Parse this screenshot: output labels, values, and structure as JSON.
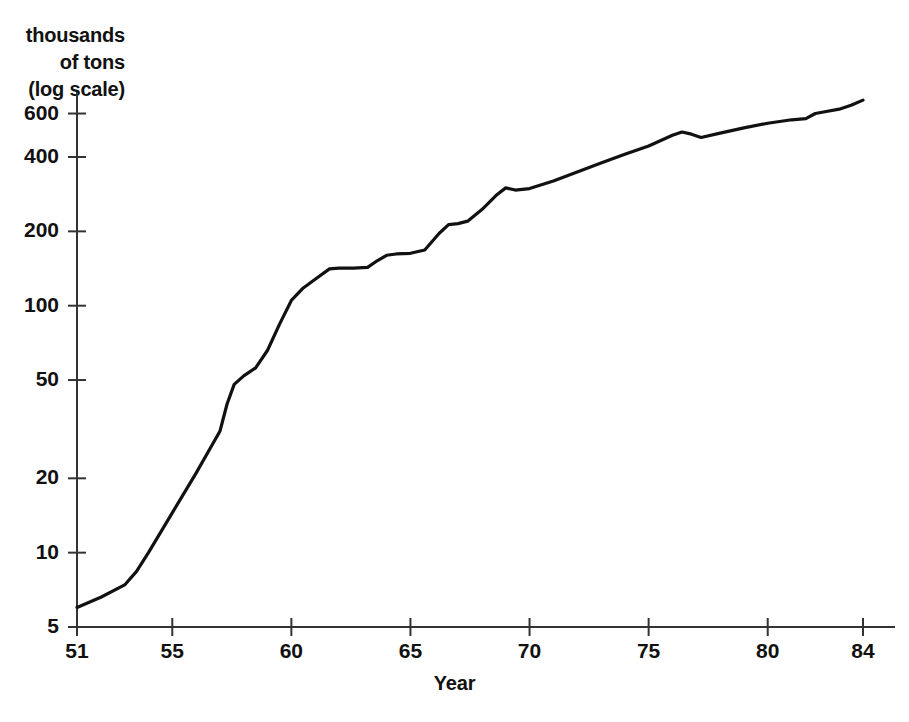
{
  "figure": {
    "y_axis_caption_lines": [
      "thousands",
      "of tons",
      "(log scale)"
    ],
    "x_axis_title": "Year"
  },
  "chart_data": {
    "type": "line",
    "title": "",
    "subtitle": "",
    "xlabel": "Year",
    "ylabel": "thousands of tons (log scale)",
    "yscale": "log",
    "xscale": "linear",
    "grid": false,
    "legend": null,
    "xlim": [
      51,
      84
    ],
    "ylim": [
      5,
      700
    ],
    "xticks": [
      51,
      55,
      60,
      65,
      70,
      75,
      80,
      84
    ],
    "xtick_labels": [
      "51",
      "55",
      "60",
      "65",
      "70",
      "75",
      "80",
      "84"
    ],
    "yticks": [
      5,
      10,
      20,
      50,
      100,
      200,
      400,
      600
    ],
    "ytick_labels": [
      "5",
      "10",
      "20",
      "50",
      "100",
      "200",
      "400",
      "600"
    ],
    "series": [
      {
        "name": "production",
        "color": "#111111",
        "x": [
          51,
          52,
          53,
          53.5,
          54,
          55,
          56,
          57,
          57.3,
          57.6,
          58,
          58.5,
          59,
          59.5,
          60,
          60.5,
          61,
          61.6,
          62,
          62.6,
          63.2,
          63.6,
          64,
          64.4,
          65,
          65.6,
          66.2,
          66.6,
          67,
          67.4,
          68,
          68.6,
          69,
          69.4,
          70,
          71,
          72,
          73,
          74,
          75,
          76,
          76.4,
          76.8,
          77.2,
          78,
          79,
          80,
          81,
          81.6,
          82,
          82.4,
          83,
          83.5,
          84
        ],
        "y": [
          6.0,
          6.6,
          7.4,
          8.4,
          10.0,
          14.5,
          21.0,
          31.0,
          40.0,
          48.0,
          52.0,
          56.0,
          66.0,
          84.0,
          105.0,
          118.0,
          128.0,
          141.0,
          142.0,
          142.0,
          143.0,
          152.0,
          160.0,
          162.0,
          163.0,
          168.0,
          196.0,
          213.0,
          215.0,
          220.0,
          245.0,
          280.0,
          300.0,
          294.0,
          298.0,
          320.0,
          348.0,
          378.0,
          410.0,
          443.0,
          490.0,
          505.0,
          495.0,
          480.0,
          500.0,
          525.0,
          548.0,
          566.0,
          572.0,
          600.0,
          610.0,
          625.0,
          648.0,
          680.0
        ]
      }
    ]
  }
}
